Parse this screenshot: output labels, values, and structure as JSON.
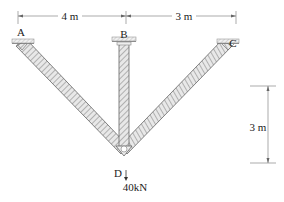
{
  "diagram": {
    "type": "truss",
    "nodes": {
      "A": {
        "label": "A"
      },
      "B": {
        "label": "B"
      },
      "C": {
        "label": "C"
      },
      "D": {
        "label": "D"
      }
    },
    "members": [
      "AD",
      "BD",
      "CD"
    ],
    "dimensions": {
      "horizontal_AB": "4 m",
      "horizontal_BC": "3 m",
      "vertical": "3 m"
    },
    "load": {
      "node": "D",
      "label": "40kN",
      "direction": "down"
    },
    "colors": {
      "line": "#555555",
      "hatch": "#888888",
      "member_fill": "#e6e6e6",
      "dimension": "#777777"
    }
  }
}
